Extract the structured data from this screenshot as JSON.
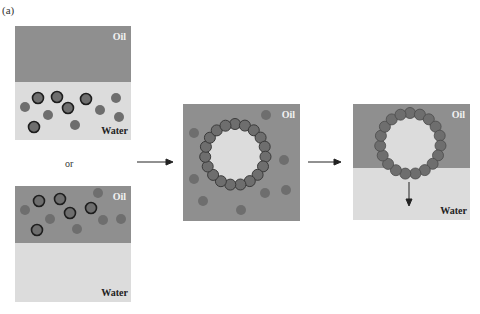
{
  "figure": {
    "panel_label": "(a)",
    "connector_text": "or",
    "colors": {
      "oil": "#8f8f8f",
      "water": "#dcdcdc",
      "particle": "#6e6e6e",
      "particle_outline": "#1e1e1e",
      "droplet_interior": "#dcdcdc",
      "arrow": "#222222"
    },
    "boxes": [
      {
        "id": "initial-water-dispersed",
        "oil_label": "Oil",
        "water_label": "Water",
        "particles_in": "water"
      },
      {
        "id": "initial-oil-dispersed",
        "oil_label": "Oil",
        "water_label": "Water",
        "particles_in": "oil"
      },
      {
        "id": "emulsified-droplet",
        "oil_label": "Oil",
        "description": "water droplet coated by particle shell in oil"
      },
      {
        "id": "sedimenting-droplet",
        "oil_label": "Oil",
        "water_label": "Water",
        "description": "coated droplet settling toward water phase"
      }
    ]
  }
}
